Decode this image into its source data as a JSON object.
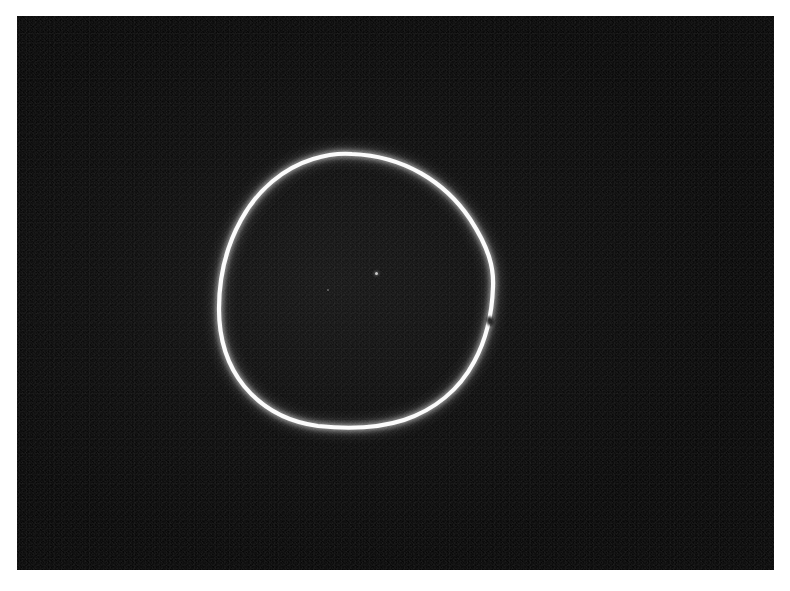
{
  "image": {
    "kind": "photographic-plate",
    "subject_label": "luminous-ring",
    "page_background_color": "#ffffff",
    "plate_background_color": "#070707",
    "ring_color": "#ffffff",
    "plate": {
      "x": 17,
      "y": 16,
      "width": 757,
      "height": 554
    },
    "canvas": {
      "width": 790,
      "height": 591
    }
  },
  "ring": {
    "name": "bright-ring",
    "description": "Single closed luminous loop, slightly egg-shaped, flattened along the lower arc",
    "bounds": {
      "left": 218,
      "top": 153,
      "right": 495,
      "bottom": 428
    },
    "width_px": 277,
    "height_px": 275,
    "center": {
      "x": 356,
      "y": 291
    },
    "stroke_width_px": 5,
    "extrema": {
      "topmost": {
        "x": 352,
        "y": 153
      },
      "bottommost": {
        "x": 330,
        "y": 427
      },
      "leftmost": {
        "x": 219,
        "y": 303
      },
      "rightmost": {
        "x": 493,
        "y": 283
      }
    },
    "path": "M 352 154 C 404 156 445 182 470 219 C 489 248 494 268 493 287 C 492 316 486 340 474 362 C 459 390 434 410 404 420 C 376 429 346 429 318 426 C 288 422 262 408 244 386 C 227 365 219 340 219 309 C 219 276 226 247 241 220 C 258 189 284 168 313 159 C 326 155 339 153 352 154 Z",
    "break": {
      "name": "ring-notch",
      "x": 490,
      "y": 321,
      "description": "small dark interruption in the bright trace on the right-hand arc"
    }
  },
  "artifacts": {
    "interior_speck": {
      "x": 375,
      "y": 272
    },
    "secondary_speck": {
      "x": 327,
      "y": 289
    },
    "grain": "fine photographic grain across the dark field"
  }
}
